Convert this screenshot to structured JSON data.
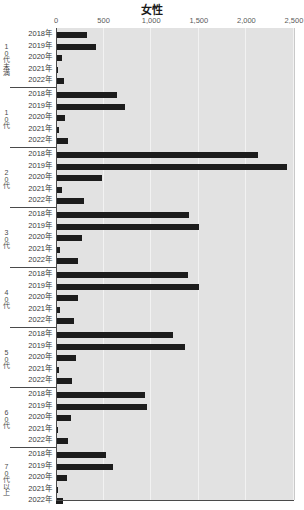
{
  "chart_data": {
    "type": "bar",
    "orientation": "horizontal",
    "title": "女性",
    "xlabel": "",
    "ylabel": "",
    "xlim": [
      0,
      2500
    ],
    "xticks": [
      0,
      500,
      1000,
      1500,
      2000,
      2500
    ],
    "xtick_labels": [
      "0",
      "500",
      "1,000",
      "1,500",
      "2,000",
      "2,500"
    ],
    "grid": true,
    "grid_axis": "x",
    "legend": false,
    "bar_color": "#1c1c1c",
    "plot_background": "#e2e2e2",
    "years": [
      "2018年",
      "2019年",
      "2020年",
      "2021年",
      "2022年"
    ],
    "groups": [
      {
        "label": "10代未満",
        "categories": [
          "2018年",
          "2019年",
          "2020年",
          "2021年",
          "2022年"
        ],
        "values": [
          330,
          420,
          60,
          20,
          85
        ]
      },
      {
        "label": "10代",
        "categories": [
          "2018年",
          "2019年",
          "2020年",
          "2021年",
          "2022年"
        ],
        "values": [
          645,
          730,
          95,
          30,
          125
        ]
      },
      {
        "label": "20代",
        "categories": [
          "2018年",
          "2019年",
          "2020年",
          "2021年",
          "2022年"
        ],
        "values": [
          2120,
          2430,
          480,
          60,
          290
        ]
      },
      {
        "label": "30代",
        "categories": [
          "2018年",
          "2019年",
          "2020年",
          "2021年",
          "2022年"
        ],
        "values": [
          1400,
          1505,
          270,
          45,
          230
        ]
      },
      {
        "label": "40代",
        "categories": [
          "2018年",
          "2019年",
          "2020年",
          "2021年",
          "2022年"
        ],
        "values": [
          1390,
          1500,
          235,
          40,
          190
        ]
      },
      {
        "label": "50代",
        "categories": [
          "2018年",
          "2019年",
          "2020年",
          "2021年",
          "2022年"
        ],
        "values": [
          1230,
          1355,
          215,
          35,
          165
        ]
      },
      {
        "label": "60代",
        "categories": [
          "2018年",
          "2019年",
          "2020年",
          "2021年",
          "2022年"
        ],
        "values": [
          940,
          960,
          155,
          25,
          130
        ]
      },
      {
        "label": "70代以上",
        "categories": [
          "2018年",
          "2019年",
          "2020年",
          "2021年",
          "2022年"
        ],
        "values": [
          520,
          600,
          115,
          20,
          70
        ]
      }
    ]
  }
}
